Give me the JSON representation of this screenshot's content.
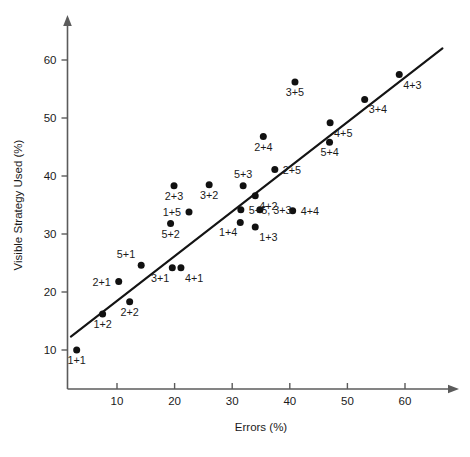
{
  "chart_data": {
    "type": "scatter",
    "title": "",
    "xlabel": "Errors (%)",
    "ylabel": "Visible Strategy Used (%)",
    "xlim": [
      0,
      68
    ],
    "ylim": [
      4,
      68
    ],
    "xticks": [
      10,
      20,
      30,
      40,
      50,
      60
    ],
    "yticks": [
      10,
      20,
      30,
      40,
      50,
      60
    ],
    "grid": false,
    "legend": "none",
    "trend_line": {
      "label": "regression line",
      "x_start": 2.0,
      "y_start": 12.3,
      "x_end": 66.5,
      "y_end": 62.0
    },
    "points": [
      {
        "label": "1+1",
        "x": 3.0,
        "y": 10.0,
        "label_pos": "below"
      },
      {
        "label": "1+2",
        "x": 7.5,
        "y": 16.2,
        "label_pos": "below"
      },
      {
        "label": "2+2",
        "x": 12.2,
        "y": 18.3,
        "label_pos": "below"
      },
      {
        "label": "2+1",
        "x": 10.3,
        "y": 21.8,
        "label_pos": "left"
      },
      {
        "label": "5+1",
        "x": 14.2,
        "y": 24.6,
        "label_pos": "above-left"
      },
      {
        "label": "3+1",
        "x": 19.6,
        "y": 24.2,
        "label_pos": "below-left"
      },
      {
        "label": "4+1",
        "x": 21.1,
        "y": 24.2,
        "label_pos": "below-right"
      },
      {
        "label": "5+2",
        "x": 19.3,
        "y": 31.8,
        "label_pos": "below"
      },
      {
        "label": "1+5",
        "x": 22.5,
        "y": 33.8,
        "label_pos": "left"
      },
      {
        "label": "2+3",
        "x": 19.9,
        "y": 38.3,
        "label_pos": "below"
      },
      {
        "label": "3+2",
        "x": 26.0,
        "y": 38.5,
        "label_pos": "below"
      },
      {
        "label": "1+4",
        "x": 31.4,
        "y": 32.0,
        "label_pos": "below-left"
      },
      {
        "label": "1+3",
        "x": 34.0,
        "y": 31.2,
        "label_pos": "below-right"
      },
      {
        "label": "5+5, 3+3",
        "x": 31.5,
        "y": 34.2,
        "label_pos": "right"
      },
      {
        "label": "",
        "x": 34.8,
        "y": 34.2,
        "label_pos": "none"
      },
      {
        "label": "4+4",
        "x": 40.5,
        "y": 34.0,
        "label_pos": "right"
      },
      {
        "label": "5+3",
        "x": 31.9,
        "y": 38.3,
        "label_pos": "above"
      },
      {
        "label": "4+2",
        "x": 34.0,
        "y": 36.6,
        "label_pos": "below-right"
      },
      {
        "label": "2+5",
        "x": 37.4,
        "y": 41.1,
        "label_pos": "right"
      },
      {
        "label": "2+4",
        "x": 35.4,
        "y": 46.8,
        "label_pos": "below"
      },
      {
        "label": "3+5",
        "x": 40.9,
        "y": 56.2,
        "label_pos": "below"
      },
      {
        "label": "5+4",
        "x": 46.9,
        "y": 45.8,
        "label_pos": "below"
      },
      {
        "label": "4+5",
        "x": 47.0,
        "y": 49.2,
        "label_pos": "below-right"
      },
      {
        "label": "3+4",
        "x": 53.0,
        "y": 53.2,
        "label_pos": "below-right"
      },
      {
        "label": "4+3",
        "x": 59.0,
        "y": 57.5,
        "label_pos": "below-right"
      }
    ]
  }
}
